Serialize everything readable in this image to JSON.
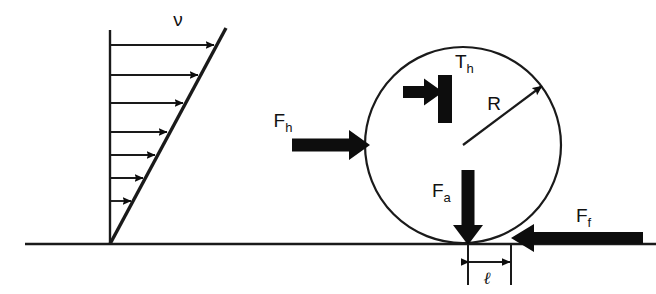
{
  "figure": {
    "background_color": "#ffffff",
    "ink_color": "#0d0d0d"
  },
  "labels": {
    "velocity": "ν",
    "traction_base": "T",
    "traction_sub": "h",
    "horizontal_force_base": "F",
    "horizontal_force_sub": "h",
    "radius": "R",
    "axial_force_base": "F",
    "axial_force_sub": "a",
    "friction_force_base": "F",
    "friction_force_sub": "f",
    "offset_length": "ℓ"
  },
  "velocity_profile": {
    "name": "velocity-profile",
    "axis": {
      "x": 110,
      "y_top": 30,
      "y_bottom": 244
    },
    "ground_contact": {
      "x": 110,
      "y": 244
    },
    "profile_line_top": {
      "x": 225,
      "y": 30
    },
    "arrow_count": 7,
    "arrows": [
      {
        "y": 45,
        "x_start": 110,
        "x_end": 213
      },
      {
        "y": 75,
        "x_start": 110,
        "x_end": 197
      },
      {
        "y": 103,
        "x_start": 110,
        "x_end": 182
      },
      {
        "y": 132,
        "x_start": 110,
        "x_end": 166
      },
      {
        "y": 155,
        "x_start": 110,
        "x_end": 154
      },
      {
        "y": 178,
        "x_start": 110,
        "x_end": 142
      },
      {
        "y": 201,
        "x_start": 110,
        "x_end": 130
      }
    ],
    "label_position": {
      "x": 178,
      "y": 26
    }
  },
  "ground": {
    "name": "ground-line",
    "y": 244,
    "x_start": 25,
    "x_end": 656
  },
  "body": {
    "name": "circular-body",
    "center": {
      "x": 463,
      "y": 145
    },
    "radius": 98
  },
  "forces": [
    {
      "name": "horizontal-force-Fh",
      "direction": "right",
      "tail": {
        "x": 292,
        "y": 145
      },
      "head": {
        "x": 368,
        "y": 145
      },
      "thickness": 14,
      "label_position": {
        "x": 283,
        "y": 125
      }
    },
    {
      "name": "traction-force-Th",
      "direction": "right",
      "tail": {
        "x": 403,
        "y": 92
      },
      "head": {
        "x": 440,
        "y": 92
      },
      "thickness": 13,
      "label_position": {
        "x": 455,
        "y": 66
      }
    },
    {
      "name": "axial-force-Fa",
      "direction": "down",
      "tail": {
        "x": 468,
        "y": 172
      },
      "head": {
        "x": 468,
        "y": 245
      },
      "thickness": 13,
      "label_position": {
        "x": 440,
        "y": 196
      }
    },
    {
      "name": "friction-force-Ff",
      "direction": "left",
      "tail": {
        "x": 643,
        "y": 238
      },
      "head": {
        "x": 512,
        "y": 238
      },
      "thickness": 13,
      "label_position": {
        "x": 578,
        "y": 220
      }
    }
  ],
  "traction_bar": {
    "name": "traction-bar",
    "x": 438,
    "y": 75,
    "width": 14,
    "height": 48
  },
  "radius_indicator": {
    "name": "radius-arrow",
    "tail": {
      "x": 463,
      "y": 145
    },
    "head": {
      "x": 543,
      "y": 85
    },
    "label_position": {
      "x": 492,
      "y": 106
    }
  },
  "offset_dimension": {
    "name": "offset-dimension-l",
    "tick_left_x": 468,
    "tick_right_x": 511,
    "tick_top_y": 244,
    "tick_bottom_y": 285,
    "arrow_y": 262,
    "label_position": {
      "x": 482,
      "y": 283
    }
  }
}
